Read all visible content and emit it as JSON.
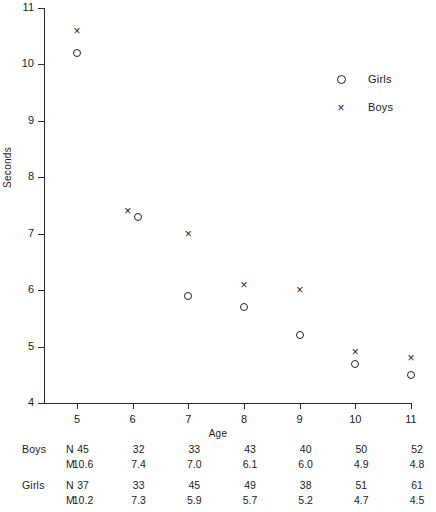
{
  "chart_data": {
    "type": "scatter",
    "title": "",
    "xlabel": "Age",
    "ylabel": "Seconds",
    "x": [
      5,
      6,
      7,
      8,
      9,
      10,
      11
    ],
    "xlim": [
      4.5,
      11.3
    ],
    "ylim": [
      4,
      11
    ],
    "xticks": [
      "5",
      "6",
      "7",
      "8",
      "9",
      "10",
      "11"
    ],
    "yticks": [
      "4",
      "5",
      "6",
      "7",
      "8",
      "9",
      "10",
      "11"
    ],
    "grid": false,
    "legend_position": "upper right",
    "series": [
      {
        "name": "Boys",
        "marker": "x",
        "values": [
          10.6,
          7.4,
          7.0,
          6.1,
          6.0,
          4.9,
          4.8
        ],
        "n": [
          45,
          32,
          33,
          43,
          40,
          50,
          52
        ]
      },
      {
        "name": "Girls",
        "marker": "o",
        "values": [
          10.2,
          7.3,
          5.9,
          5.7,
          5.2,
          4.7,
          4.5
        ],
        "n": [
          37,
          33,
          45,
          49,
          38,
          51,
          61
        ]
      }
    ]
  },
  "legend": {
    "entries": [
      {
        "label": "Girls",
        "marker": "circle-marker"
      },
      {
        "label": "Boys",
        "marker": "cross-marker"
      }
    ]
  },
  "axes": {
    "y_title": "Seconds",
    "x_title": "Age"
  },
  "table": {
    "stat_labels": {
      "count": "N",
      "mean": "M"
    },
    "groups": [
      {
        "name": "Boys",
        "count_row": [
          "45",
          "32",
          "33",
          "43",
          "40",
          "50",
          "52"
        ],
        "mean_row": [
          "10.6",
          "7.4",
          "7.0",
          "6.1",
          "6.0",
          "4.9",
          "4.8"
        ]
      },
      {
        "name": "Girls",
        "count_row": [
          "37",
          "33",
          "45",
          "49",
          "38",
          "51",
          "61"
        ],
        "mean_row": [
          "10.2",
          "7.3",
          "5.9",
          "5.7",
          "5.2",
          "4.7",
          "4.5"
        ]
      }
    ]
  },
  "colors": {
    "ink": "#1b1b1b",
    "axis": "#2a2a2a",
    "background": "#ffffff"
  }
}
